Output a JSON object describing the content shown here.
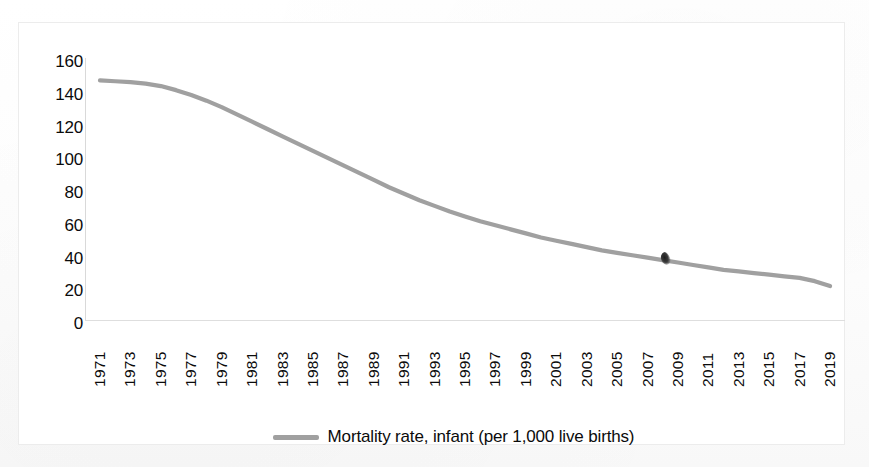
{
  "chart_data": {
    "type": "line",
    "title": "",
    "xlabel": "",
    "ylabel": "",
    "ylim": [
      0,
      160
    ],
    "y_ticks": [
      "0",
      "20",
      "40",
      "60",
      "80",
      "100",
      "120",
      "140",
      "160"
    ],
    "grid": false,
    "legend_position": "bottom",
    "legend_entries": [
      "Mortality rate, infant (per 1,000 live births)"
    ],
    "series": [
      {
        "name": "Mortality rate, infant (per 1,000 live births)",
        "color": "#a0a0a0",
        "values": [
          148,
          147.5,
          147,
          146,
          144.5,
          142,
          139,
          135.5,
          131.5,
          127,
          122.5,
          118,
          113.5,
          109,
          104.5,
          100,
          95.5,
          91,
          86.5,
          82,
          78,
          74,
          70.5,
          67,
          64,
          61,
          58.5,
          56,
          53.5,
          51,
          49,
          47,
          45,
          43,
          41.5,
          40,
          38.5,
          37,
          35.5,
          34,
          32.5,
          31,
          30,
          29,
          28,
          27,
          26,
          24,
          21
        ]
      }
    ],
    "x": [
      1971,
      1972,
      1973,
      1974,
      1975,
      1976,
      1977,
      1978,
      1979,
      1980,
      1981,
      1982,
      1983,
      1984,
      1985,
      1986,
      1987,
      1988,
      1989,
      1990,
      1991,
      1992,
      1993,
      1994,
      1995,
      1996,
      1997,
      1998,
      1999,
      2000,
      2001,
      2002,
      2003,
      2004,
      2005,
      2006,
      2007,
      2008,
      2009,
      2010,
      2011,
      2012,
      2013,
      2014,
      2015,
      2016,
      2017,
      2018,
      2019
    ],
    "x_tick_labels": [
      "1971",
      "1973",
      "1975",
      "1977",
      "1979",
      "1981",
      "1983",
      "1985",
      "1987",
      "1989",
      "1991",
      "1993",
      "1995",
      "1997",
      "1999",
      "2001",
      "2003",
      "2005",
      "2007",
      "2009",
      "2011",
      "2013",
      "2015",
      "2017",
      "2019"
    ]
  },
  "legend": {
    "label": "Mortality rate, infant (per 1,000 live births)",
    "swatch_name": "line-swatch"
  },
  "colors": {
    "line": "#a0a0a0",
    "axis": "#d9d9d9",
    "text": "#0b0b0b",
    "background": "#ffffff"
  }
}
